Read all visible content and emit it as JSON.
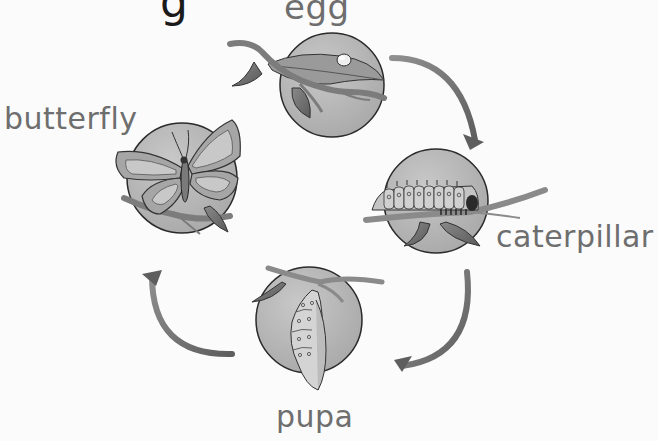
{
  "diagram": {
    "title_fragment": "g",
    "stages": [
      {
        "id": "egg",
        "label": "egg"
      },
      {
        "id": "caterpillar",
        "label": "caterpillar"
      },
      {
        "id": "pupa",
        "label": "pupa"
      },
      {
        "id": "butterfly",
        "label": "butterfly"
      }
    ],
    "flow": [
      {
        "from": "egg",
        "to": "caterpillar"
      },
      {
        "from": "caterpillar",
        "to": "pupa"
      },
      {
        "from": "pupa",
        "to": "butterfly"
      }
    ],
    "colors": {
      "label": "#6e6e6e",
      "circle_fill": "#b9b9b9",
      "circle_stroke": "#2a2a2a",
      "arrow": "#7a7a7a",
      "branch": "#8a8a8a",
      "leaf": "#6f6f6f"
    }
  }
}
